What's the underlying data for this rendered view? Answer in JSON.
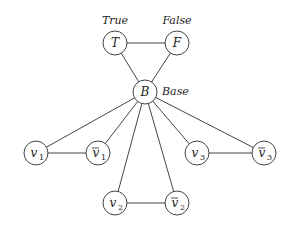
{
  "diagram": {
    "nodes": [
      {
        "id": "T",
        "label": "T",
        "sub": "",
        "bar": false,
        "x": 115,
        "y": 43,
        "r": 12,
        "ext_label": "True",
        "ext_x": 115,
        "ext_y": 24,
        "ext_anchor": "middle"
      },
      {
        "id": "F",
        "label": "F",
        "sub": "",
        "bar": false,
        "x": 177,
        "y": 43,
        "r": 12,
        "ext_label": "False",
        "ext_x": 177,
        "ext_y": 24,
        "ext_anchor": "middle"
      },
      {
        "id": "B",
        "label": "B",
        "sub": "",
        "bar": false,
        "x": 145,
        "y": 92,
        "r": 12,
        "ext_label": "Base",
        "ext_x": 162,
        "ext_y": 95,
        "ext_anchor": "start"
      },
      {
        "id": "v1",
        "label": "v",
        "sub": "1",
        "bar": false,
        "x": 36,
        "y": 153,
        "r": 12
      },
      {
        "id": "v1bar",
        "label": "v",
        "sub": "1",
        "bar": true,
        "x": 98,
        "y": 153,
        "r": 12
      },
      {
        "id": "v3",
        "label": "v",
        "sub": "3",
        "bar": false,
        "x": 197,
        "y": 153,
        "r": 12
      },
      {
        "id": "v3bar",
        "label": "v",
        "sub": "3",
        "bar": true,
        "x": 264,
        "y": 153,
        "r": 12
      },
      {
        "id": "v2",
        "label": "v",
        "sub": "2",
        "bar": false,
        "x": 115,
        "y": 203,
        "r": 12
      },
      {
        "id": "v2bar",
        "label": "v",
        "sub": "2",
        "bar": true,
        "x": 177,
        "y": 203,
        "r": 12
      }
    ],
    "edges": [
      [
        "T",
        "F"
      ],
      [
        "T",
        "B"
      ],
      [
        "F",
        "B"
      ],
      [
        "B",
        "v1"
      ],
      [
        "B",
        "v1bar"
      ],
      [
        "B",
        "v2"
      ],
      [
        "B",
        "v2bar"
      ],
      [
        "B",
        "v3"
      ],
      [
        "B",
        "v3bar"
      ],
      [
        "v1",
        "v1bar"
      ],
      [
        "v2",
        "v2bar"
      ],
      [
        "v3",
        "v3bar"
      ]
    ],
    "colors": {
      "stroke": "#444444",
      "text": "#222222",
      "background": "#ffffff"
    }
  }
}
